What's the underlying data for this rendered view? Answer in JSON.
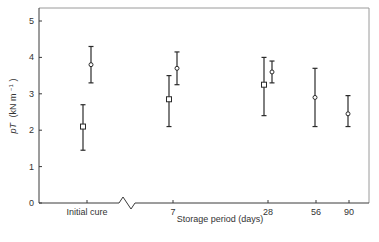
{
  "chart_data": {
    "type": "scatter",
    "title": "",
    "xlabel": "Storage period (days)",
    "ylabel": "pT (kN m⁻¹)",
    "ylabel_parts": {
      "symbol": "pT",
      "unit": "(kN m",
      "exp": "−1",
      "close": ")"
    },
    "ylim": [
      0,
      5.3
    ],
    "yticks": [
      0,
      1,
      2,
      3,
      4,
      5
    ],
    "grid": false,
    "legend": null,
    "x_axis_break": true,
    "categories": [
      "Initial cure",
      "7",
      "28",
      "56",
      "90"
    ],
    "series": [
      {
        "name": "square markers",
        "marker": "square",
        "points": [
          {
            "category": "Initial cure",
            "value": 2.1,
            "lower": 1.45,
            "upper": 2.7
          },
          {
            "category": "7",
            "value": 2.85,
            "lower": 2.1,
            "upper": 3.5
          },
          {
            "category": "28",
            "value": 3.25,
            "lower": 2.4,
            "upper": 4.0
          }
        ]
      },
      {
        "name": "circle markers",
        "marker": "circle",
        "points": [
          {
            "category": "Initial cure",
            "value": 3.8,
            "lower": 3.3,
            "upper": 4.3
          },
          {
            "category": "7",
            "value": 3.7,
            "lower": 3.25,
            "upper": 4.15
          },
          {
            "category": "28",
            "value": 3.6,
            "lower": 3.3,
            "upper": 3.9
          },
          {
            "category": "56",
            "value": 2.9,
            "lower": 2.1,
            "upper": 3.7
          },
          {
            "category": "90",
            "value": 2.45,
            "lower": 2.1,
            "upper": 2.95
          }
        ]
      }
    ]
  },
  "layout": {
    "plot_left": 39,
    "plot_right": 369,
    "plot_top": 8,
    "plot_bottom": 203,
    "y_px_per_unit": 36.4,
    "category_x": {
      "Initial cure": 87,
      "7": 173,
      "28": 268,
      "56": 316,
      "90": 349
    },
    "series_offset_x": {
      "square markers": -4,
      "circle markers": 4
    },
    "single_offset_x": -1,
    "break_x": 127
  }
}
